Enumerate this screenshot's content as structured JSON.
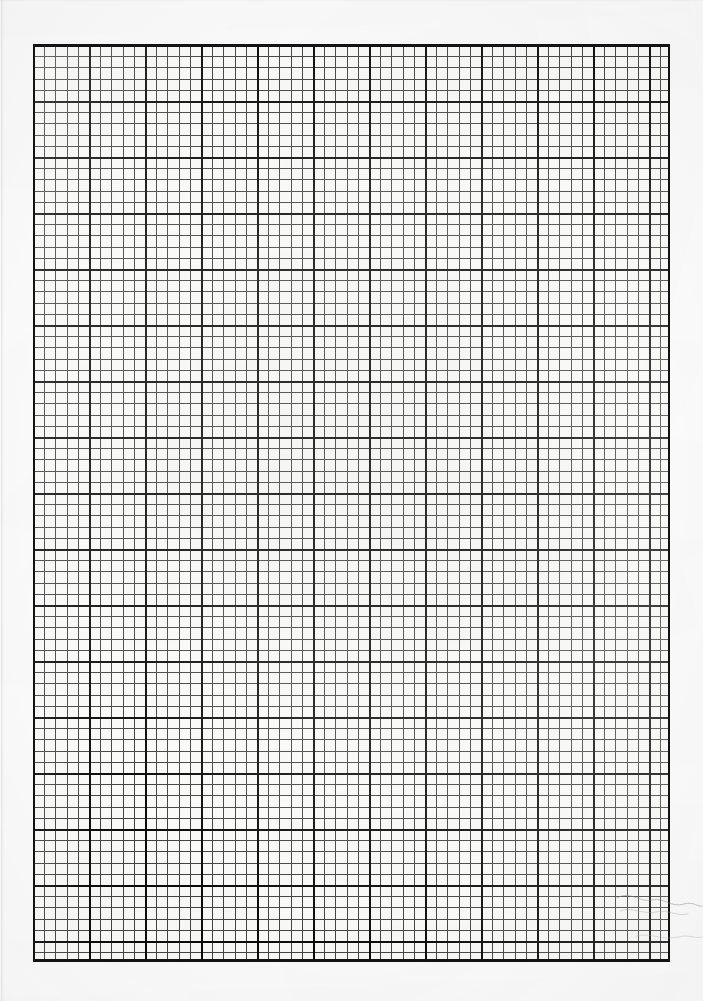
{
  "document": {
    "kind": "scanned-graph-paper",
    "title": "Graph paper sheet",
    "caption": "",
    "paper_color": "#fdfdfd",
    "ink_color": "#1c1c1e",
    "major_ink_color": "#0c0c0e",
    "border_color": "#141416"
  },
  "grid": {
    "origin_x": 33,
    "origin_y": 45,
    "width": 637,
    "height": 917,
    "fine_cell_px": 11.2,
    "major_cell_px": 56,
    "cells_per_major": 5,
    "fine_columns": 57,
    "fine_rows": 82,
    "major_columns": 11,
    "major_rows": 16,
    "border_enabled": "true"
  },
  "artifacts": {
    "left_edge_shadow": "true",
    "top_edge_shadow": "true",
    "crease_bottom_right": "true",
    "scan_noise": "true",
    "vignette": "true"
  },
  "labels": {
    "page_label": "",
    "margin_note": ""
  }
}
